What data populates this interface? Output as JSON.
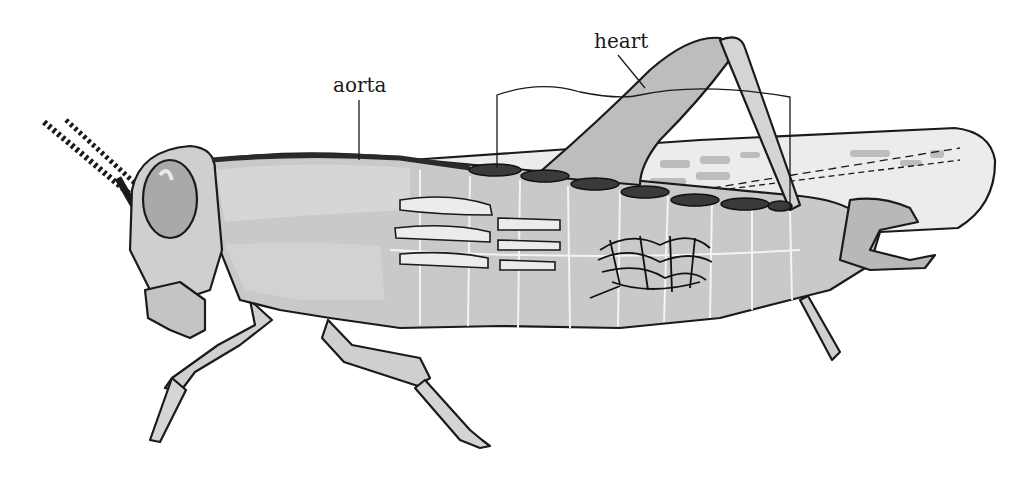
{
  "diagram": {
    "labels": {
      "aorta": "aorta",
      "heart": "heart"
    },
    "colors": {
      "background": "#ffffff",
      "body_fill": "#c9c9c9",
      "body_light": "#dcdcdc",
      "wing_fill": "#ececec",
      "vessel": "#2a2a2a",
      "outline": "#1a1a1a"
    }
  }
}
